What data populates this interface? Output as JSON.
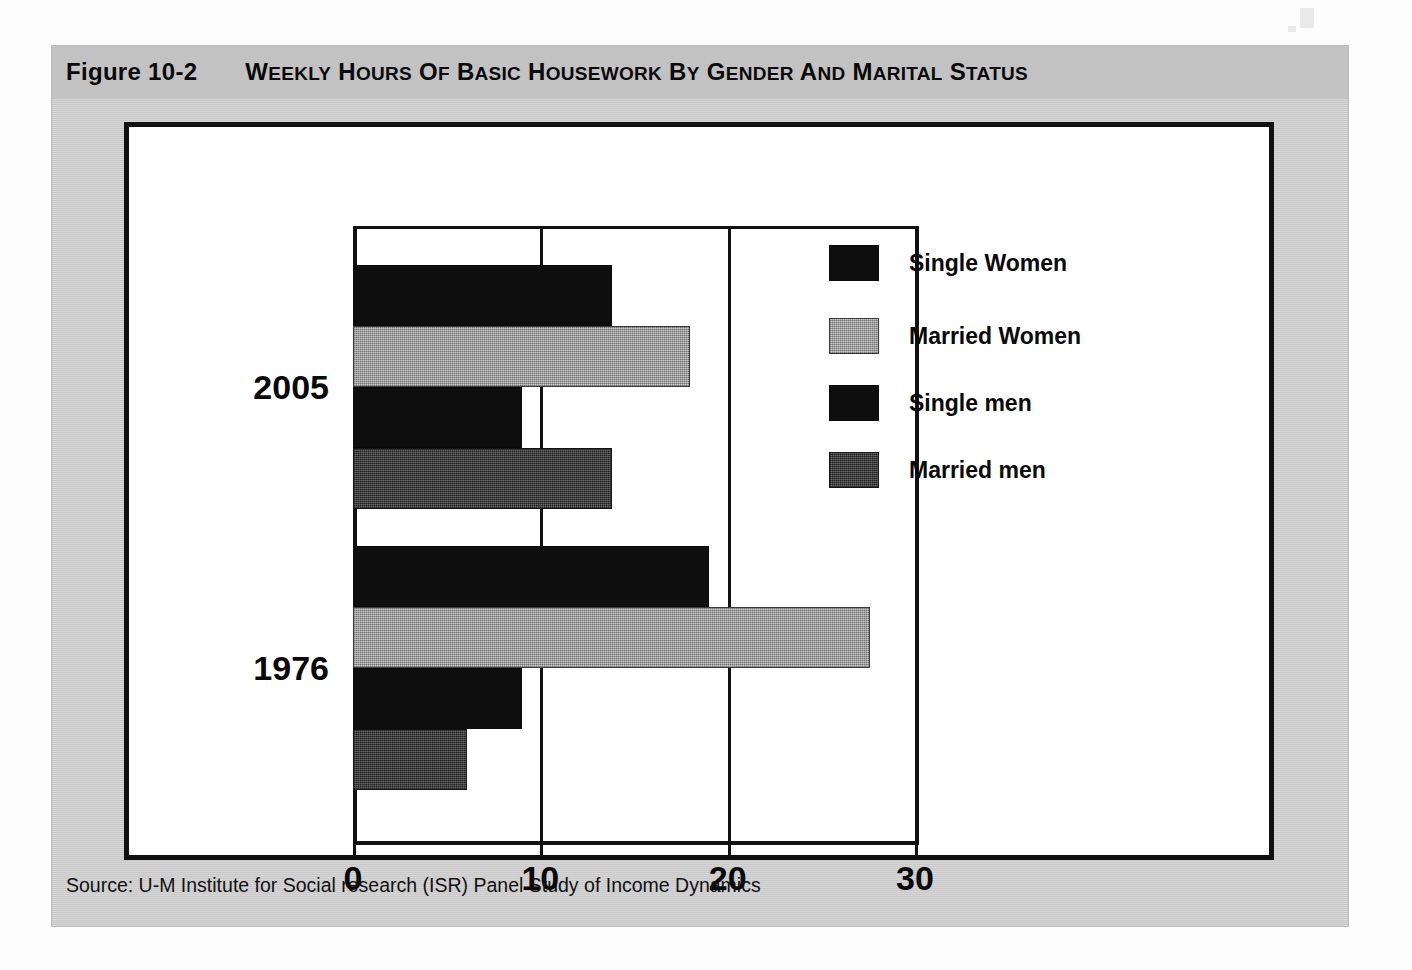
{
  "figure": {
    "number": "Figure 10-2",
    "title": "Weekly Hours of Basic Housework by Gender and Marital Status",
    "source": "Source: U-M Institute for Social research (ISR) Panel Study of Income Dynamics"
  },
  "colors": {
    "single_women": "#0e0e0e",
    "married_women": "#8f8f8f",
    "single_men": "#0e0e0e",
    "married_men": "#2e2e2e",
    "band": "#c2c2c2",
    "card": "#c9c9c9",
    "ink": "#111111"
  },
  "chart_data": {
    "type": "bar",
    "orientation": "horizontal",
    "title": "Weekly Hours of Basic Housework by Gender and Marital Status",
    "xlabel": "",
    "ylabel": "",
    "xlim": [
      0,
      30
    ],
    "xticks": [
      0,
      10,
      20,
      30
    ],
    "xticklabels": [
      "0",
      "10",
      "20",
      "30"
    ],
    "grid": true,
    "grid_axis": "x",
    "legend_position": "right",
    "categories": [
      "2005",
      "1976"
    ],
    "series": [
      {
        "name": "Single Women",
        "color": "#0e0e0e",
        "values": [
          13.8,
          19.0
        ]
      },
      {
        "name": "Married Women",
        "color": "#8f8f8f",
        "values": [
          18.0,
          27.6
        ]
      },
      {
        "name": "Single men",
        "color": "#0e0e0e",
        "values": [
          9.0,
          9.0
        ]
      },
      {
        "name": "Married men",
        "color": "#2e2e2e",
        "values": [
          13.8,
          6.1
        ]
      }
    ]
  },
  "legend": {
    "items": [
      {
        "label": "Single Women",
        "swatch": "black"
      },
      {
        "label": "Married Women",
        "swatch": "light-gray"
      },
      {
        "label": "Single men",
        "swatch": "black"
      },
      {
        "label": "Married men",
        "swatch": "dark-gray"
      }
    ]
  }
}
